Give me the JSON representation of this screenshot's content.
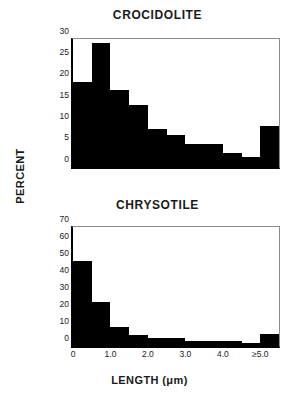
{
  "figure": {
    "ylabel": "PERCENT",
    "xlabel": "LENGTH (μm)"
  },
  "chart_data": [
    {
      "type": "bar",
      "title": "CROCIDOLITE",
      "xlabel": "LENGTH (μm)",
      "ylabel": "PERCENT",
      "ylim": [
        0,
        30
      ],
      "yticks": [
        "0",
        "5",
        "10",
        "15",
        "20",
        "25",
        "30"
      ],
      "ytick_values": [
        0,
        5,
        10,
        15,
        20,
        25,
        30
      ],
      "xlim": [
        0,
        5.5
      ],
      "xticks": [
        "0",
        "1.0",
        "2.0",
        "3.0",
        "4.0",
        "≥5.0"
      ],
      "xtick_values": [
        0,
        1.0,
        2.0,
        3.0,
        4.0,
        5.0
      ],
      "xtick_labels_visible": false,
      "grid": false,
      "legend": false,
      "bin_width": 0.5,
      "bin_starts": [
        0.0,
        0.5,
        1.0,
        1.5,
        2.0,
        2.5,
        3.0,
        3.5,
        4.0,
        4.5,
        5.0
      ],
      "categories": [
        "0.0-0.5",
        "0.5-1.0",
        "1.0-1.5",
        "1.5-2.0",
        "2.0-2.5",
        "2.5-3.0",
        "3.0-3.5",
        "3.5-4.0",
        "4.0-4.5",
        "4.5-5.0",
        "≥5.0"
      ],
      "values": [
        20,
        29,
        18,
        14.5,
        9,
        7.5,
        5.5,
        5.3,
        3.2,
        2.3,
        9.5
      ],
      "bar_color": "#000000"
    },
    {
      "type": "bar",
      "title": "CHRYSOTILE",
      "xlabel": "LENGTH (μm)",
      "ylabel": "PERCENT",
      "ylim": [
        0,
        70
      ],
      "yticks": [
        "0",
        "10",
        "20",
        "30",
        "40",
        "50",
        "60",
        "70"
      ],
      "ytick_values": [
        0,
        10,
        20,
        30,
        40,
        50,
        60,
        70
      ],
      "xlim": [
        0,
        5.5
      ],
      "xticks": [
        "0",
        "1.0",
        "2.0",
        "3.0",
        "4.0",
        "≥5.0"
      ],
      "xtick_values": [
        0,
        1.0,
        2.0,
        3.0,
        4.0,
        5.0
      ],
      "xtick_labels_visible": true,
      "grid": false,
      "legend": false,
      "bin_width": 0.5,
      "bin_starts": [
        0.0,
        0.5,
        1.0,
        1.5,
        2.0,
        2.5,
        3.0,
        3.5,
        4.0,
        4.5,
        5.0
      ],
      "categories": [
        "0.0-0.5",
        "0.5-1.0",
        "1.0-1.5",
        "1.5-2.0",
        "2.0-2.5",
        "2.5-3.0",
        "3.0-3.5",
        "3.5-4.0",
        "4.0-4.5",
        "4.5-5.0",
        "≥5.0"
      ],
      "values": [
        50,
        26,
        11,
        6.5,
        5,
        4.5,
        3.2,
        3.2,
        3.2,
        2,
        6.8
      ],
      "bar_color": "#000000"
    }
  ]
}
